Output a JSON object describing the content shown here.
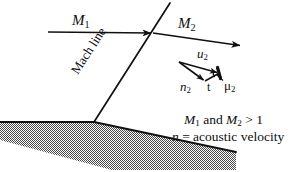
{
  "figure": {
    "stroke_color": "#111111",
    "ground_fill": "#8c8c8c"
  },
  "labels": {
    "m1": "M",
    "m1_sub": "1",
    "m2": "M",
    "m2_sub": "2",
    "mach_line": "Mach line",
    "u2": "u",
    "u2_sub": "2",
    "n2": "n",
    "n2_sub": "2",
    "t": "t",
    "mu2": "μ",
    "mu2_sub": "2"
  },
  "notes": {
    "line1": "M₁ and M₂ > 1",
    "line1_parts": {
      "a": "M",
      "a_sub": "1",
      "b": " and ",
      "c": "M",
      "c_sub": "2",
      "d": " > 1"
    },
    "line2": "n = acoustic velocity",
    "line2_parts": {
      "a": "n",
      "b": " = acoustic velocity"
    }
  },
  "geometry": {
    "m1_arrow": {
      "x1": 48,
      "y1": 32,
      "x2": 153,
      "y2": 33
    },
    "m2_arrow": {
      "x1": 153,
      "y1": 33,
      "x2": 242,
      "y2": 46
    },
    "mach_line": {
      "x1": 94,
      "y1": 122,
      "x2": 170,
      "y2": 4
    },
    "ground_flat": {
      "x1": 0,
      "y1": 122,
      "x2": 94,
      "y2": 122
    },
    "ground_slope": {
      "x1": 94,
      "y1": 122,
      "x2": 236,
      "y2": 152
    },
    "triangle": {
      "apex": {
        "x": 179,
        "y": 62
      },
      "right": {
        "x": 219,
        "y": 73
      },
      "lower": {
        "x": 205,
        "y": 81
      }
    }
  }
}
